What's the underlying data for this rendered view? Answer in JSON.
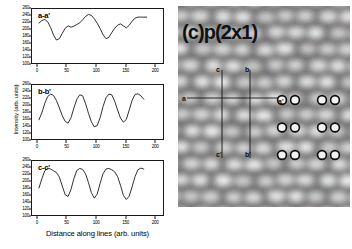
{
  "figure": {
    "axis_label_x": "Distance along lines (arb. units)",
    "axis_label_y": "Intensity (arb. units)"
  },
  "stm": {
    "caption": "(c)p(2x1)",
    "line_labels": {
      "a": "a",
      "a_prime": "a'",
      "b": "b",
      "b_prime": "b'",
      "c": "c",
      "c_prime": "c'"
    },
    "overlay_model": {
      "name": "adatom-circle-lattice",
      "rows": 3,
      "columns": 4,
      "marker": "open-circle-white-fill"
    }
  },
  "chart_data": [
    {
      "type": "line",
      "title": "a-a'",
      "xlabel": "",
      "ylabel": "Intensity (arb. units)",
      "xlim": [
        -10,
        215
      ],
      "ylim": [
        100,
        260
      ],
      "xticks": [
        0,
        50,
        100,
        150,
        200
      ],
      "yticks": [
        100,
        120,
        140,
        160,
        180,
        200,
        220,
        240,
        260
      ],
      "grid": false,
      "x": [
        2,
        7,
        12,
        17,
        22,
        27,
        32,
        37,
        42,
        47,
        52,
        57,
        62,
        67,
        72,
        77,
        82,
        87,
        92,
        97,
        102,
        107,
        112,
        117,
        122,
        127,
        132,
        137,
        142,
        147,
        152,
        157,
        162,
        167,
        172,
        177,
        182,
        187
      ],
      "y": [
        218,
        226,
        229,
        222,
        205,
        183,
        168,
        172,
        188,
        203,
        210,
        206,
        209,
        214,
        219,
        228,
        238,
        244,
        241,
        231,
        218,
        202,
        184,
        172,
        176,
        190,
        203,
        212,
        216,
        210,
        204,
        212,
        224,
        233,
        236,
        236,
        236,
        236
      ]
    },
    {
      "type": "line",
      "title": "b-b'",
      "xlabel": "",
      "ylabel": "Intensity (arb. units)",
      "xlim": [
        -10,
        215
      ],
      "ylim": [
        100,
        260
      ],
      "xticks": [
        0,
        50,
        100,
        150,
        200
      ],
      "yticks": [
        100,
        120,
        140,
        160,
        180,
        200,
        220,
        240,
        260
      ],
      "grid": false,
      "x": [
        2,
        7,
        12,
        17,
        22,
        27,
        32,
        37,
        42,
        47,
        52,
        57,
        62,
        67,
        72,
        77,
        82,
        87,
        92,
        97,
        102,
        107,
        112,
        117,
        122,
        127,
        132,
        137,
        142,
        147,
        152,
        157,
        162,
        167,
        172,
        177,
        182
      ],
      "y": [
        157,
        178,
        206,
        226,
        233,
        229,
        214,
        192,
        169,
        152,
        147,
        163,
        192,
        218,
        231,
        228,
        205,
        176,
        151,
        136,
        140,
        163,
        196,
        222,
        233,
        231,
        212,
        186,
        162,
        150,
        158,
        186,
        215,
        232,
        234,
        228,
        218
      ]
    },
    {
      "type": "line",
      "title": "c-c'",
      "xlabel": "Distance along lines (arb. units)",
      "ylabel": "Intensity (arb. units)",
      "xlim": [
        -10,
        215
      ],
      "ylim": [
        100,
        260
      ],
      "xticks": [
        0,
        50,
        100,
        150,
        200
      ],
      "yticks": [
        100,
        120,
        140,
        160,
        180,
        200,
        220,
        240,
        260
      ],
      "grid": false,
      "x": [
        2,
        7,
        12,
        17,
        22,
        27,
        32,
        37,
        42,
        47,
        52,
        57,
        62,
        67,
        72,
        77,
        82,
        87,
        92,
        97,
        102,
        107,
        112,
        117,
        122,
        127,
        132,
        137,
        142,
        147,
        152,
        157,
        162,
        167,
        172,
        177,
        182
      ],
      "y": [
        180,
        208,
        231,
        239,
        236,
        231,
        226,
        212,
        186,
        160,
        155,
        176,
        208,
        232,
        238,
        235,
        222,
        196,
        166,
        150,
        162,
        194,
        222,
        236,
        238,
        234,
        228,
        214,
        188,
        158,
        146,
        156,
        184,
        214,
        234,
        239,
        236
      ]
    }
  ]
}
